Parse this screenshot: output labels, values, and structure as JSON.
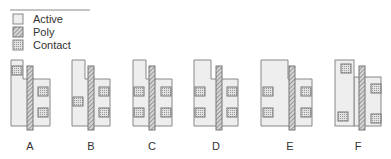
{
  "legend": {
    "items": [
      {
        "label": "Active",
        "swatch": "active"
      },
      {
        "label": "Poly",
        "swatch": "poly"
      },
      {
        "label": "Contact",
        "swatch": "contact"
      }
    ]
  },
  "colors": {
    "active_fill": "#eeeeee",
    "active_stroke": "#888888",
    "poly_fill": "#cccccc",
    "poly_stroke": "#777777",
    "contact_fill": "#d8d8d8",
    "contact_stroke": "#777777",
    "text": "#333333"
  },
  "layouts": [
    {
      "label": "A"
    },
    {
      "label": "B"
    },
    {
      "label": "C"
    },
    {
      "label": "D"
    },
    {
      "label": "E"
    },
    {
      "label": "F"
    }
  ]
}
